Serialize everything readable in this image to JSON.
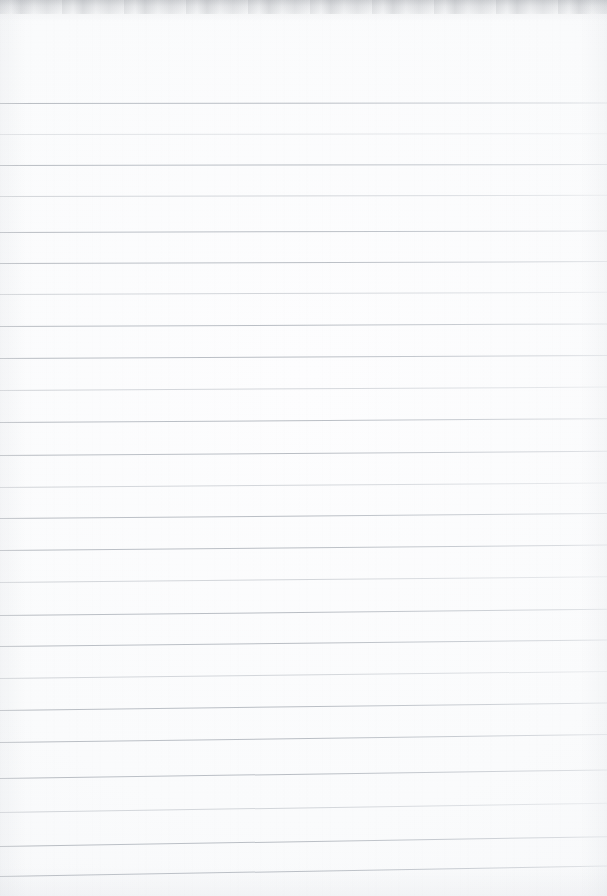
{
  "document": {
    "kind": "lined-notebook-page",
    "title": "Blank ruled notebook page",
    "content_text": "",
    "is_blank": true,
    "page_width": 607,
    "page_height": 896
  },
  "paper": {
    "background_color": "#fbfbfc",
    "edge_shadow_color": "#787c84",
    "vignette_color": "#d2d5da",
    "texture": "vertical scan streaks with faint horizontal grain"
  },
  "ruling": {
    "line_color": "#b0b5bc",
    "line_thickness_px": 1,
    "line_spacing_px": 31.3,
    "first_line_y": 103,
    "last_line_y": 876,
    "line_count": 25,
    "top_margin_px": 103,
    "skew_note": "lines level at top, tilting progressively up-to-the-right toward the bottom",
    "max_skew_rise_px": 10,
    "lines": [
      {
        "y": 103,
        "tilt": -0.6,
        "weight": "normal"
      },
      {
        "y": 134,
        "tilt": -0.8,
        "weight": "faint"
      },
      {
        "y": 165,
        "tilt": -1.0,
        "weight": "normal"
      },
      {
        "y": 196,
        "tilt": -1.2,
        "weight": "soft"
      },
      {
        "y": 232,
        "tilt": -1.6,
        "weight": "normal"
      },
      {
        "y": 263,
        "tilt": -1.9,
        "weight": "normal"
      },
      {
        "y": 294,
        "tilt": -2.2,
        "weight": "soft"
      },
      {
        "y": 326,
        "tilt": -2.6,
        "weight": "normal"
      },
      {
        "y": 358,
        "tilt": -3.0,
        "weight": "normal"
      },
      {
        "y": 390,
        "tilt": -3.4,
        "weight": "soft"
      },
      {
        "y": 421.5,
        "tilt": -3.8,
        "weight": "normal"
      },
      {
        "y": 455,
        "tilt": -4.2,
        "weight": "normal"
      },
      {
        "y": 487,
        "tilt": -4.6,
        "weight": "soft"
      },
      {
        "y": 518,
        "tilt": -5.0,
        "weight": "normal"
      },
      {
        "y": 550,
        "tilt": -5.4,
        "weight": "normal"
      },
      {
        "y": 582,
        "tilt": -5.8,
        "weight": "soft"
      },
      {
        "y": 615,
        "tilt": -6.2,
        "weight": "normal"
      },
      {
        "y": 646,
        "tilt": -6.6,
        "weight": "normal"
      },
      {
        "y": 678,
        "tilt": -7.0,
        "weight": "soft"
      },
      {
        "y": 710,
        "tilt": -7.5,
        "weight": "normal"
      },
      {
        "y": 742,
        "tilt": -8.0,
        "weight": "normal"
      },
      {
        "y": 778,
        "tilt": -8.6,
        "weight": "normal"
      },
      {
        "y": 812,
        "tilt": -9.2,
        "weight": "soft"
      },
      {
        "y": 846,
        "tilt": -9.8,
        "weight": "normal"
      },
      {
        "y": 876,
        "tilt": -10.4,
        "weight": "normal"
      }
    ]
  }
}
